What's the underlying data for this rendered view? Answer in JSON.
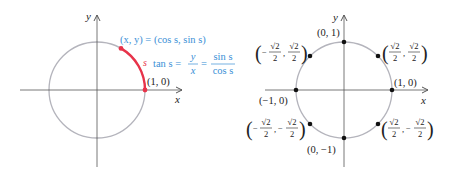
{
  "colors": {
    "circle": "#b4b4bc",
    "axis": "#555555",
    "arc": "#e8334a",
    "blue": "#3a8fd6",
    "black": "#222222"
  },
  "left": {
    "y_axis_label": "y",
    "x_axis_label": "x",
    "point_label": "(x, y) = (cos s, sin s)",
    "arc_label": "s",
    "tan_prefix": "tan s =",
    "frac1_num": "y",
    "frac1_den": "x",
    "eq": "=",
    "frac2_num": "sin s",
    "frac2_den": "cos s",
    "one_zero_label": "(1, 0)"
  },
  "right": {
    "y_axis_label": "y",
    "x_axis_label": "x",
    "points": {
      "top": "(0, 1)",
      "bottom": "(0, −1)",
      "right": "(1, 0)",
      "left": "(−1, 0)"
    },
    "sqrt2": "√2",
    "two": "2",
    "minus": "−",
    "comma": ","
  }
}
